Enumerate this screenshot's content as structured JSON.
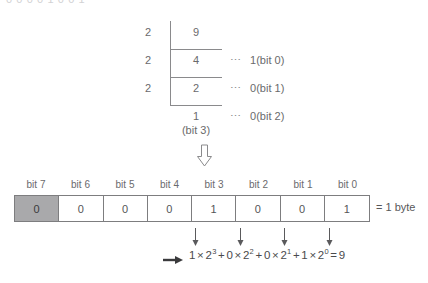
{
  "figure": {
    "clipped_top_text": "0  0  0  0  1  0  0  1",
    "division": {
      "divisors": [
        "2",
        "2",
        "2"
      ],
      "quotients": [
        "9",
        "4",
        "2",
        "1"
      ],
      "final_quotient_label": "(bit 3)",
      "remainders": [
        {
          "dots": "⋯",
          "text": "1(bit 0)"
        },
        {
          "dots": "⋯",
          "text": "0(bit 1)"
        },
        {
          "dots": "⋯",
          "text": "0(bit 2)"
        }
      ]
    },
    "flow_arrow": "⇩",
    "byte_table": {
      "headers": [
        "bit 7",
        "bit 6",
        "bit 5",
        "bit 4",
        "bit 3",
        "bit 2",
        "bit 1",
        "bit 0"
      ],
      "values": [
        "0",
        "0",
        "0",
        "0",
        "1",
        "0",
        "0",
        "1"
      ],
      "highlighted_index": 0,
      "highlight_color": "#a9a9ab",
      "label": "= 1 byte"
    },
    "equation": {
      "lead_arrow": "➜",
      "terms": [
        {
          "coef": "1",
          "times": "×",
          "base": "2",
          "exp": "3"
        },
        {
          "coef": "0",
          "times": "×",
          "base": "2",
          "exp": "2"
        },
        {
          "coef": "0",
          "times": "×",
          "base": "2",
          "exp": "1"
        },
        {
          "coef": "1",
          "times": "×",
          "base": "2",
          "exp": "0"
        }
      ],
      "plus": "+",
      "equals": "=",
      "result": "9"
    }
  }
}
